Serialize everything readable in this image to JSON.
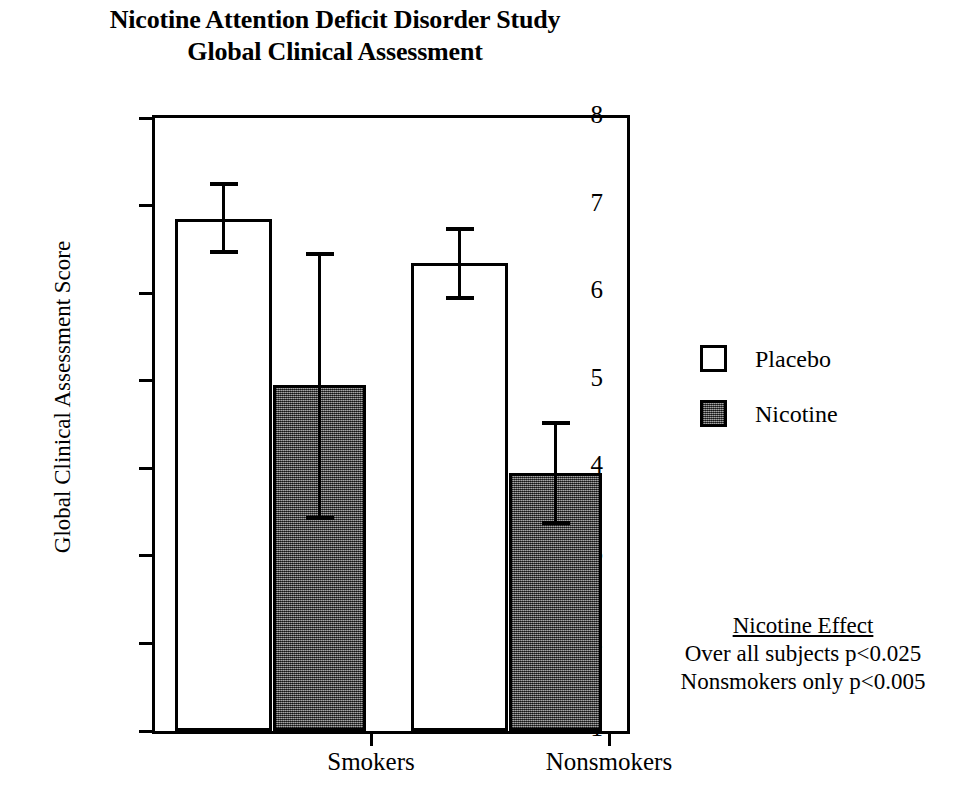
{
  "title": {
    "line1": "Nicotine Attention Deficit Disorder Study",
    "line2": "Global Clinical Assessment"
  },
  "axes": {
    "ylabel": "Global Clinical Assessment Score",
    "yticks": [
      "1",
      "2",
      "3",
      "4",
      "5",
      "6",
      "7",
      "8"
    ],
    "xticklabels": [
      "Smokers",
      "Nonsmokers"
    ]
  },
  "legend": {
    "items": [
      {
        "label": "Placebo",
        "swatch": "open-square",
        "color": "#ffffff"
      },
      {
        "label": "Nicotine",
        "swatch": "filled-square",
        "color": "#5a5a5a"
      }
    ]
  },
  "annotation": {
    "heading": "Nicotine Effect",
    "line1": "Over all subjects p<0.025",
    "line2": "Nonsmokers only p<0.005"
  },
  "chart_data": {
    "type": "bar",
    "xlabel": "",
    "ylabel": "Global Clinical Assessment Score",
    "ylim": [
      1,
      8
    ],
    "yticks": [
      1,
      2,
      3,
      4,
      5,
      6,
      7,
      8
    ],
    "grid": false,
    "legend_position": "right",
    "categories": [
      "Smokers",
      "Nonsmokers"
    ],
    "series": [
      {
        "name": "Placebo",
        "color": "#ffffff",
        "values": [
          6.85,
          6.35
        ],
        "errors_upper": [
          0.4,
          0.38
        ],
        "errors_lower": [
          0.38,
          0.4
        ]
      },
      {
        "name": "Nicotine",
        "color": "#5a5a5a",
        "values": [
          4.95,
          3.95
        ],
        "errors_upper": [
          1.5,
          0.57
        ],
        "errors_lower": [
          1.52,
          0.58
        ]
      }
    ],
    "annotations": [
      "Nicotine Effect",
      "Over all subjects p<0.025",
      "Nonsmokers only p<0.005"
    ]
  },
  "geometry": {
    "y_min": 1,
    "y_max": 8,
    "plot_width": 472,
    "plot_height": 613,
    "bars": [
      {
        "name": "placebo-smokers",
        "series": 0,
        "category": 0,
        "left": 20,
        "width": 97,
        "value": 6.85,
        "err_up": 0.4,
        "err_dn": 0.38
      },
      {
        "name": "nicotine-smokers",
        "series": 1,
        "category": 0,
        "left": 118,
        "width": 93,
        "value": 4.95,
        "err_up": 1.5,
        "err_dn": 1.52
      },
      {
        "name": "placebo-nonsmokers",
        "series": 0,
        "category": 1,
        "left": 256,
        "width": 97,
        "value": 6.35,
        "err_up": 0.38,
        "err_dn": 0.4
      },
      {
        "name": "nicotine-nonsmokers",
        "series": 1,
        "category": 1,
        "left": 354,
        "width": 93,
        "value": 3.95,
        "err_up": 0.57,
        "err_dn": 0.58
      }
    ],
    "xtick_positions": [
      216,
      454
    ],
    "xlabel_positions": [
      216,
      454
    ]
  }
}
